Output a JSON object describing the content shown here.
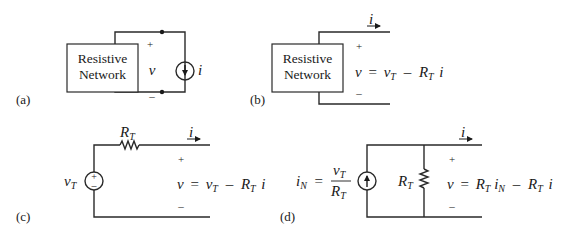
{
  "panels": {
    "a": {
      "label": "(a)",
      "box_line1": "Resistive",
      "box_line2": "Network",
      "plus": "+",
      "voltage": "v",
      "minus": "–",
      "source_label": "i",
      "source_type": "current-source-down-arrow"
    },
    "b": {
      "label": "(b)",
      "box_line1": "Resistive",
      "box_line2": "Network",
      "current": "i",
      "plus": "+",
      "minus": "–",
      "eq_v": "v",
      "eq_eq": "=",
      "eq_vT": "v",
      "eq_vT_sub": "T",
      "eq_minus": "–",
      "eq_RT": "R",
      "eq_RT_sub": "T",
      "eq_i": "i"
    },
    "c": {
      "label": "(c)",
      "resistor_label": "R",
      "resistor_sub": "T",
      "source_label": "v",
      "source_sub": "T",
      "source_type": "voltage-source-plus-minus",
      "source_plus": "+",
      "source_minus": "–",
      "current": "i",
      "plus": "+",
      "minus": "–",
      "eq_v": "v",
      "eq_eq": "=",
      "eq_vT": "v",
      "eq_vT_sub": "T",
      "eq_minus": "–",
      "eq_RT": "R",
      "eq_RT_sub": "T",
      "eq_i": "i"
    },
    "d": {
      "label": "(d)",
      "src_iN": "i",
      "src_iN_sub": "N",
      "src_eq": "=",
      "src_num": "v",
      "src_num_sub": "T",
      "src_den": "R",
      "src_den_sub": "T",
      "source_type": "current-source-up-arrow",
      "resistor_label": "R",
      "resistor_sub": "T",
      "current": "i",
      "plus": "+",
      "minus": "–",
      "eq_v": "v",
      "eq_eq": "=",
      "eq_R1": "R",
      "eq_R1_sub": "T",
      "eq_iN": "i",
      "eq_iN_sub": "N",
      "eq_minus": "–",
      "eq_R2": "R",
      "eq_R2_sub": "T",
      "eq_i": "i"
    }
  }
}
